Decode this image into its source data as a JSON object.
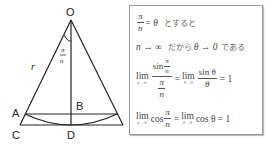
{
  "diagram": {
    "points": {
      "O": "O",
      "A": "A",
      "B": "B",
      "C": "C",
      "D": "D"
    },
    "radius_label": "r",
    "angle_label": {
      "num": "π",
      "den": "n"
    }
  },
  "box": {
    "line1": {
      "num": "π",
      "den": "n",
      "rhs": "= θ",
      "jp": "とすると"
    },
    "line2": {
      "text": "n → ∞",
      "jp1": "だから",
      "mid": "θ → 0",
      "jp2": "である"
    },
    "line3": {
      "lim1": "lim",
      "sub1": "n→∞",
      "inner_num_prefix": "sin",
      "inner_num_frac_num": "π",
      "inner_num_frac_den": "n",
      "inner_den_num": "π",
      "inner_den_den": "n",
      "eq1": "=",
      "lim2": "lim",
      "sub2": "θ→0",
      "frac2_num": "sin θ",
      "frac2_den": "θ",
      "result": "= 1"
    },
    "line4": {
      "lim1": "lim",
      "sub1": "n→∞",
      "cos": "cos",
      "frac_num": "π",
      "frac_den": "n",
      "eq1": "=",
      "lim2": "lim",
      "sub2": "θ→0",
      "rhs": "cos θ = 1"
    }
  }
}
